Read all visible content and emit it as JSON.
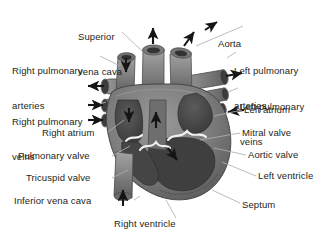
{
  "figure": {
    "background_color": "#ffffff",
    "text_color": "#231f20",
    "leader_line_color": "#a8a8a8",
    "arrow_color": "#1a1a1a"
  },
  "labels": [
    {
      "id": "superior-vena-cava",
      "text": "Superior\nvena cava",
      "line1": "Superior",
      "line2": "vena cava",
      "x": 78,
      "y": 10,
      "align": "left"
    },
    {
      "id": "aorta",
      "text": "Aorta",
      "line1": "Aorta",
      "line2": "",
      "x": 218,
      "y": 16,
      "align": "left"
    },
    {
      "id": "right-pulmonary-arteries",
      "text": "Right pulmonary\narteries",
      "line1": "Right pulmonary",
      "line2": "arteries",
      "x": 12,
      "y": 44,
      "align": "left"
    },
    {
      "id": "left-pulmonary-arteries",
      "text": "Left pulmonary\narteries",
      "line1": "Left pulmonary",
      "line2": "arteries",
      "x": 234,
      "y": 44,
      "align": "left"
    },
    {
      "id": "right-pulmonary-veins",
      "text": "Right pulmonary\nveins",
      "line1": "Right pulmonary",
      "line2": "veins",
      "x": 12,
      "y": 94,
      "align": "left"
    },
    {
      "id": "left-pulmonary-veins",
      "text": "Left pulmonary\nveins",
      "line1": "Left pulmonary",
      "line2": "veins",
      "x": 240,
      "y": 80,
      "align": "left"
    },
    {
      "id": "left-atrium",
      "text": "Left atrium",
      "line1": "Left atrium",
      "line2": "",
      "x": 244,
      "y": 105,
      "align": "left"
    },
    {
      "id": "right-atrium",
      "text": "Right atrium",
      "line1": "Right atrium",
      "line2": "",
      "x": 42,
      "y": 128,
      "align": "left"
    },
    {
      "id": "mitral-valve",
      "text": "Mitral valve",
      "line1": "Mitral valve",
      "line2": "",
      "x": 242,
      "y": 128,
      "align": "left"
    },
    {
      "id": "pulmonary-valve",
      "text": "Pulmonary valve",
      "line1": "Pulmonary valve",
      "line2": "",
      "x": 18,
      "y": 151,
      "align": "left"
    },
    {
      "id": "aortic-valve",
      "text": "Aortic valve",
      "line1": "Aortic valve",
      "line2": "",
      "x": 248,
      "y": 150,
      "align": "left"
    },
    {
      "id": "tricuspid-valve",
      "text": "Tricuspid valve",
      "line1": "Tricuspid valve",
      "line2": "",
      "x": 26,
      "y": 173,
      "align": "left"
    },
    {
      "id": "left-ventricle",
      "text": "Left ventricle",
      "line1": "Left ventricle",
      "line2": "",
      "x": 258,
      "y": 171,
      "align": "left"
    },
    {
      "id": "inferior-vena-cava",
      "text": "Inferior vena cava",
      "line1": "Inferior vena cava",
      "line2": "",
      "x": 14,
      "y": 196,
      "align": "left"
    },
    {
      "id": "septum",
      "text": "Septum",
      "line1": "Septum",
      "line2": "",
      "x": 242,
      "y": 200,
      "align": "left"
    },
    {
      "id": "right-ventricle",
      "text": "Right ventricle",
      "line1": "Right ventricle",
      "line2": "",
      "x": 114,
      "y": 219,
      "align": "left"
    }
  ],
  "flow_arrows": [
    {
      "id": "svc-inflow-arrow",
      "direction": "down",
      "meaning": "blood entering from superior vena cava"
    },
    {
      "id": "pulmonary-trunk-outflow-arrow",
      "direction": "up",
      "meaning": "blood leaving via pulmonary trunk"
    },
    {
      "id": "aorta-outflow-arrow",
      "direction": "up-right",
      "meaning": "blood leaving via aorta"
    },
    {
      "id": "right-pulmonary-artery-arrow",
      "direction": "left",
      "meaning": "blood to right lung"
    },
    {
      "id": "left-pulmonary-artery-arrow",
      "direction": "right",
      "meaning": "blood to left lung"
    },
    {
      "id": "right-pulmonary-vein-arrow-upper",
      "direction": "right",
      "meaning": "blood returning from right lung"
    },
    {
      "id": "right-pulmonary-vein-arrow-lower",
      "direction": "right",
      "meaning": "blood returning from right lung"
    },
    {
      "id": "left-pulmonary-vein-arrow",
      "direction": "left",
      "meaning": "blood returning from left lung"
    },
    {
      "id": "ivc-inflow-arrow",
      "direction": "up",
      "meaning": "blood entering from inferior vena cava"
    },
    {
      "id": "right-atrium-flow-arrow",
      "direction": "down",
      "meaning": "flow through tricuspid valve"
    },
    {
      "id": "right-ventricle-flow-arrow",
      "direction": "up",
      "meaning": "flow out of right ventricle"
    },
    {
      "id": "left-ventricle-flow-arrow",
      "direction": "down-right",
      "meaning": "flow into left ventricle"
    }
  ],
  "structures": [
    {
      "id": "heart-body",
      "name": "heart muscle (myocardium)",
      "fill": "#7c7c7c"
    },
    {
      "id": "chamber-cavity",
      "name": "chamber cavities",
      "fill": "#4a4a4a"
    },
    {
      "id": "valve-leaflets",
      "name": "valve leaflets",
      "fill": "#f2f2ee"
    },
    {
      "id": "vessel-tubes",
      "name": "great vessels",
      "fill": "#8a8a8a"
    }
  ]
}
